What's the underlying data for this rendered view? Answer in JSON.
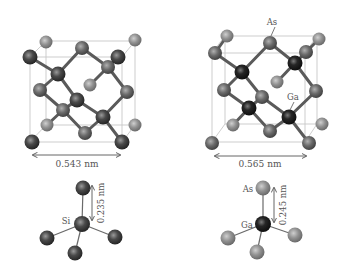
{
  "figure": {
    "panels": [
      {
        "id": "si",
        "title": "Silicon diamond lattice",
        "lattice_constant_label": "0.543 nm",
        "bond_length_label": "0.235 nm",
        "center_atom_label": "Si",
        "atom_labels": []
      },
      {
        "id": "gaas",
        "title": "GaAs zinc-blende lattice",
        "lattice_constant_label": "0.565 nm",
        "bond_length_label": "0.245 nm",
        "center_atom_label": "Ga",
        "top_atom_label": "As",
        "atom_labels": [
          "As",
          "Ga"
        ]
      }
    ],
    "colors": {
      "atom_dark": "#3a3a3a",
      "atom_mid": "#5c5c5c",
      "atom_light": "#8a8a8a",
      "atom_ga": "#1e1e1e",
      "bond": "#5a5a5a",
      "cell_edge": "#c8c8c8",
      "text": "#555555"
    }
  }
}
